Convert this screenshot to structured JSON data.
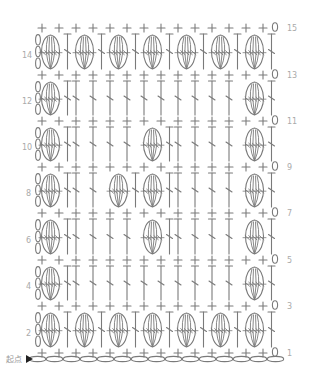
{
  "start_label": "起点",
  "colors": {
    "stroke": "#7a7a7a",
    "label": "#aaaaaa",
    "background": "#ffffff",
    "arrow": "#222222"
  },
  "grid": {
    "columns": 14,
    "col_x0": 42,
    "col_dx": 17,
    "foundation_chain_count": 15,
    "chain_y": 359
  },
  "legend_symbols": {
    "sc": "+ (single crochet)",
    "ch": "0 / oval (chain)",
    "dc": "T (double crochet)",
    "bobble": "oval cluster (bobble)"
  },
  "rows": [
    {
      "num": 1,
      "type": "sc",
      "y": 353
    },
    {
      "num": 2,
      "type": "pattern",
      "y": 330,
      "bobble_slots": [
        0,
        1,
        2,
        3,
        4,
        5,
        6
      ],
      "label_side": "left"
    },
    {
      "num": 3,
      "type": "sc",
      "y": 306
    },
    {
      "num": 4,
      "type": "pattern",
      "y": 283,
      "bobble_slots": [
        0,
        6
      ],
      "label_side": "left"
    },
    {
      "num": 5,
      "type": "sc",
      "y": 260
    },
    {
      "num": 6,
      "type": "pattern",
      "y": 237,
      "bobble_slots": [
        0,
        3,
        6
      ],
      "label_side": "left"
    },
    {
      "num": 7,
      "type": "sc",
      "y": 213
    },
    {
      "num": 8,
      "type": "pattern",
      "y": 190,
      "bobble_slots": [
        0,
        2,
        3,
        6
      ],
      "label_side": "left"
    },
    {
      "num": 9,
      "type": "sc",
      "y": 167
    },
    {
      "num": 10,
      "type": "pattern",
      "y": 144,
      "bobble_slots": [
        0,
        3,
        6
      ],
      "label_side": "left"
    },
    {
      "num": 11,
      "type": "sc",
      "y": 121
    },
    {
      "num": 12,
      "type": "pattern",
      "y": 98,
      "bobble_slots": [
        0,
        6
      ],
      "label_side": "left"
    },
    {
      "num": 13,
      "type": "sc",
      "y": 75
    },
    {
      "num": 14,
      "type": "pattern",
      "y": 52,
      "bobble_slots": [
        0,
        1,
        2,
        3,
        4,
        5,
        6
      ],
      "label_side": "left"
    },
    {
      "num": 15,
      "type": "sc",
      "y": 28
    }
  ],
  "labels": {
    "r1": "1",
    "r2": "2",
    "r3": "3",
    "r4": "4",
    "r5": "5",
    "r6": "6",
    "r7": "7",
    "r8": "8",
    "r9": "9",
    "r10": "10",
    "r11": "11",
    "r12": "12",
    "r13": "13",
    "r14": "14",
    "r15": "15"
  }
}
